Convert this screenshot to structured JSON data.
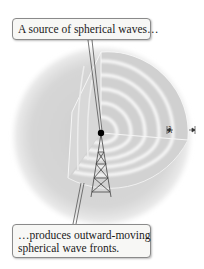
{
  "diagram": {
    "callouts": {
      "top": "A source of spherical waves…",
      "bottom_line1": "…produces outward-moving",
      "bottom_line2": "spherical wave fronts."
    },
    "wavelength_label": "λ",
    "elements": {
      "sphere": "cut-away sphere of wave fronts",
      "source": "point source (black dot)",
      "tower": "radio transmission tower"
    },
    "colors": {
      "sphere_fill": "#d4d4d4",
      "ring": "#f2f2f2",
      "source_dot": "#000000",
      "tower_line": "#444444",
      "callout_border": "#8a8a8a"
    }
  }
}
